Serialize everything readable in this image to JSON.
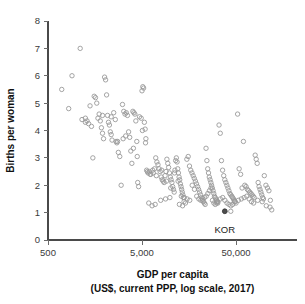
{
  "chart_data": {
    "type": "scatter",
    "title": "",
    "xlabel": "GDP per capita",
    "xlabel_sub": "(US$, current PPP, log scale, 2017)",
    "ylabel": "Births per woman",
    "xscale": "log",
    "xlim": [
      500,
      120000
    ],
    "ylim": [
      0,
      8
    ],
    "xticks": [
      500,
      5000,
      50000
    ],
    "xticklabels": [
      "500",
      "5,000",
      "50,000"
    ],
    "yticks": [
      0,
      1,
      2,
      3,
      4,
      5,
      6,
      7,
      8
    ],
    "yticklabels": [
      "0",
      "1",
      "2",
      "3",
      "4",
      "5",
      "6",
      "7",
      "8"
    ],
    "grid": false,
    "legend": "none",
    "marker": "open-circle",
    "marker_color": "#9a9a9a",
    "highlight_color": "#4d4d4d",
    "annotations": [
      {
        "label": "KOR",
        "x": 38000,
        "y": 1.05,
        "dx": 0,
        "dy": -22
      }
    ],
    "series": [
      {
        "name": "countries",
        "points": [
          [
            700,
            5.5
          ],
          [
            830,
            4.8
          ],
          [
            900,
            6.0
          ],
          [
            1100,
            7.0
          ],
          [
            1250,
            4.3
          ],
          [
            1300,
            4.35
          ],
          [
            1350,
            4.25
          ],
          [
            1400,
            4.9
          ],
          [
            1450,
            4.15
          ],
          [
            1500,
            3.0
          ],
          [
            1550,
            5.25
          ],
          [
            1600,
            5.2
          ],
          [
            1650,
            5.0
          ],
          [
            1700,
            4.45
          ],
          [
            1750,
            4.6
          ],
          [
            1800,
            4.35
          ],
          [
            1850,
            4.1
          ],
          [
            1900,
            3.9
          ],
          [
            1950,
            3.7
          ],
          [
            2000,
            5.95
          ],
          [
            2050,
            5.85
          ],
          [
            2100,
            5.3
          ],
          [
            2150,
            4.55
          ],
          [
            2200,
            4.3
          ],
          [
            2250,
            4.2
          ],
          [
            2300,
            3.95
          ],
          [
            2350,
            3.85
          ],
          [
            2400,
            3.65
          ],
          [
            2500,
            4.65
          ],
          [
            2600,
            4.4
          ],
          [
            2650,
            3.6
          ],
          [
            2700,
            3.55
          ],
          [
            2800,
            3.2
          ],
          [
            2900,
            3.05
          ],
          [
            3000,
            2.0
          ],
          [
            3100,
            4.95
          ],
          [
            3200,
            4.7
          ],
          [
            3300,
            4.6
          ],
          [
            3400,
            4.65
          ],
          [
            3500,
            4.55
          ],
          [
            3600,
            3.95
          ],
          [
            3700,
            3.75
          ],
          [
            3800,
            3.25
          ],
          [
            3900,
            2.8
          ],
          [
            4000,
            4.7
          ],
          [
            4100,
            4.65
          ],
          [
            4200,
            4.6
          ],
          [
            4300,
            4.35
          ],
          [
            4400,
            3.6
          ],
          [
            4500,
            2.1
          ],
          [
            4700,
            4.5
          ],
          [
            4900,
            4.45
          ],
          [
            5000,
            5.45
          ],
          [
            5100,
            5.6
          ],
          [
            5200,
            5.55
          ],
          [
            5300,
            4.3
          ],
          [
            5400,
            4.05
          ],
          [
            5500,
            3.7
          ],
          [
            5600,
            2.55
          ],
          [
            5700,
            2.5
          ],
          [
            5800,
            2.45
          ],
          [
            6000,
            2.5
          ],
          [
            6200,
            2.4
          ],
          [
            6400,
            1.25
          ],
          [
            6600,
            2.45
          ],
          [
            6800,
            2.6
          ],
          [
            7000,
            3.0
          ],
          [
            7200,
            2.85
          ],
          [
            7400,
            2.75
          ],
          [
            7600,
            2.6
          ],
          [
            7800,
            2.5
          ],
          [
            8000,
            2.3
          ],
          [
            8200,
            2.2
          ],
          [
            8400,
            2.15
          ],
          [
            8600,
            2.1
          ],
          [
            8800,
            2.35
          ],
          [
            9000,
            2.5
          ],
          [
            9200,
            2.95
          ],
          [
            9400,
            2.8
          ],
          [
            9600,
            2.65
          ],
          [
            9800,
            2.45
          ],
          [
            10000,
            2.3
          ],
          [
            10200,
            2.2
          ],
          [
            10400,
            2.1
          ],
          [
            10600,
            1.95
          ],
          [
            10800,
            1.85
          ],
          [
            11000,
            1.75
          ],
          [
            11200,
            2.55
          ],
          [
            11400,
            2.9
          ],
          [
            11600,
            3.0
          ],
          [
            11800,
            2.85
          ],
          [
            12000,
            2.6
          ],
          [
            12200,
            2.45
          ],
          [
            12400,
            2.3
          ],
          [
            12600,
            2.2
          ],
          [
            12800,
            2.05
          ],
          [
            13000,
            1.95
          ],
          [
            13200,
            1.85
          ],
          [
            13400,
            1.75
          ],
          [
            13600,
            1.65
          ],
          [
            13800,
            1.55
          ],
          [
            14000,
            1.4
          ],
          [
            14500,
            1.35
          ],
          [
            15000,
            2.95
          ],
          [
            15500,
            3.05
          ],
          [
            16000,
            2.7
          ],
          [
            16500,
            2.55
          ],
          [
            17000,
            2.45
          ],
          [
            17500,
            2.35
          ],
          [
            18000,
            2.25
          ],
          [
            18500,
            2.15
          ],
          [
            19000,
            2.05
          ],
          [
            19500,
            1.95
          ],
          [
            20000,
            1.85
          ],
          [
            20500,
            1.75
          ],
          [
            21000,
            1.65
          ],
          [
            21500,
            1.55
          ],
          [
            22000,
            1.45
          ],
          [
            22500,
            1.4
          ],
          [
            23000,
            1.35
          ],
          [
            23500,
            1.3
          ],
          [
            24000,
            3.35
          ],
          [
            24500,
            2.9
          ],
          [
            25000,
            2.6
          ],
          [
            25500,
            2.45
          ],
          [
            26000,
            2.3
          ],
          [
            26500,
            2.2
          ],
          [
            27000,
            2.1
          ],
          [
            27500,
            2.0
          ],
          [
            28000,
            1.9
          ],
          [
            28500,
            1.8
          ],
          [
            29000,
            1.7
          ],
          [
            29500,
            1.6
          ],
          [
            30000,
            1.55
          ],
          [
            30500,
            1.5
          ],
          [
            31000,
            1.45
          ],
          [
            31500,
            1.4
          ],
          [
            32000,
            1.35
          ],
          [
            33000,
            4.2
          ],
          [
            34000,
            3.9
          ],
          [
            35000,
            2.9
          ],
          [
            36000,
            2.55
          ],
          [
            37000,
            2.35
          ],
          [
            38000,
            2.2
          ],
          [
            39000,
            2.1
          ],
          [
            40000,
            2.0
          ],
          [
            41000,
            1.9
          ],
          [
            42000,
            1.8
          ],
          [
            43000,
            1.7
          ],
          [
            44000,
            1.65
          ],
          [
            45000,
            1.6
          ],
          [
            46000,
            1.55
          ],
          [
            47000,
            1.5
          ],
          [
            48000,
            1.45
          ],
          [
            49000,
            1.4
          ],
          [
            50000,
            1.35
          ],
          [
            52000,
            4.6
          ],
          [
            54000,
            2.6
          ],
          [
            56000,
            2.4
          ],
          [
            58000,
            1.9
          ],
          [
            60000,
            3.6
          ],
          [
            62000,
            2.0
          ],
          [
            64000,
            1.95
          ],
          [
            66000,
            1.85
          ],
          [
            68000,
            1.8
          ],
          [
            70000,
            1.75
          ],
          [
            72000,
            1.7
          ],
          [
            74000,
            1.65
          ],
          [
            76000,
            1.6
          ],
          [
            78000,
            1.55
          ],
          [
            80000,
            3.1
          ],
          [
            82000,
            2.95
          ],
          [
            84000,
            2.8
          ],
          [
            86000,
            2.1
          ],
          [
            88000,
            1.95
          ],
          [
            90000,
            1.85
          ],
          [
            92000,
            1.75
          ],
          [
            94000,
            1.65
          ],
          [
            96000,
            1.55
          ],
          [
            98000,
            1.5
          ],
          [
            100000,
            2.35
          ],
          [
            104000,
            2.0
          ],
          [
            108000,
            1.9
          ],
          [
            112000,
            1.8
          ],
          [
            116000,
            1.45
          ],
          [
            120000,
            1.1
          ],
          [
            6500,
            2.55
          ],
          [
            7100,
            2.35
          ],
          [
            8100,
            2.55
          ],
          [
            9100,
            2.15
          ],
          [
            10100,
            1.9
          ],
          [
            11100,
            2.45
          ],
          [
            12100,
            2.15
          ],
          [
            13100,
            1.6
          ],
          [
            14100,
            1.55
          ],
          [
            15100,
            1.5
          ],
          [
            16100,
            1.45
          ],
          [
            17100,
            2.0
          ],
          [
            18100,
            1.85
          ],
          [
            19100,
            1.6
          ],
          [
            20100,
            1.5
          ],
          [
            21100,
            1.45
          ],
          [
            22100,
            1.5
          ],
          [
            23100,
            1.55
          ],
          [
            24100,
            1.6
          ],
          [
            25100,
            1.7
          ],
          [
            26100,
            1.8
          ],
          [
            27100,
            1.9
          ],
          [
            28100,
            1.45
          ],
          [
            29100,
            1.35
          ],
          [
            30100,
            1.3
          ],
          [
            31100,
            1.35
          ],
          [
            32100,
            1.4
          ],
          [
            34100,
            1.5
          ],
          [
            36100,
            1.55
          ],
          [
            38100,
            1.45
          ],
          [
            40100,
            1.35
          ],
          [
            42100,
            1.3
          ],
          [
            44100,
            1.25
          ],
          [
            46100,
            1.3
          ],
          [
            48100,
            1.4
          ],
          [
            53000,
            1.45
          ],
          [
            57000,
            1.5
          ],
          [
            61000,
            1.55
          ],
          [
            65000,
            1.6
          ],
          [
            69000,
            1.5
          ],
          [
            73000,
            1.4
          ],
          [
            77000,
            1.35
          ],
          [
            85000,
            1.45
          ],
          [
            95000,
            1.4
          ],
          [
            105000,
            1.25
          ],
          [
            115000,
            1.2
          ],
          [
            4600,
            1.95
          ],
          [
            5900,
            1.35
          ],
          [
            6900,
            1.3
          ],
          [
            7900,
            1.45
          ],
          [
            8900,
            1.5
          ],
          [
            9900,
            1.55
          ],
          [
            12500,
            1.3
          ],
          [
            13500,
            1.25
          ],
          [
            2750,
            3.6
          ],
          [
            3150,
            3.7
          ],
          [
            3350,
            3.8
          ],
          [
            4050,
            3.35
          ],
          [
            4450,
            3.05
          ],
          [
            1150,
            4.4
          ],
          [
            1250,
            4.45
          ],
          [
            1900,
            4.55
          ],
          [
            2350,
            4.5
          ],
          [
            5050,
            4.0
          ],
          [
            5450,
            3.55
          ],
          [
            6100,
            2.4
          ],
          [
            44000,
            1.05
          ]
        ]
      }
    ]
  }
}
